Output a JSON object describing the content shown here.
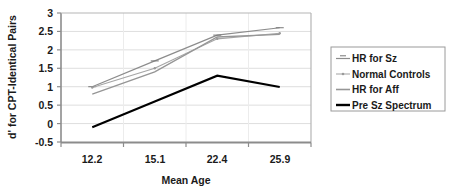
{
  "chart_data": {
    "type": "line",
    "title": "",
    "xlabel": "Mean Age",
    "ylabel": "d' for CPT-Identical Pairs",
    "categories": [
      "12.2",
      "15.1",
      "22.4",
      "25.9"
    ],
    "ylim": [
      -0.5,
      3
    ],
    "ytick_labels": [
      "3",
      "2.5",
      "2",
      "1.5",
      "1",
      "0.5",
      "0",
      "-0.5"
    ],
    "ytick_values": [
      3,
      2.5,
      2,
      1.5,
      1,
      0.5,
      0,
      -0.5
    ],
    "grid": true,
    "legend_position": "right",
    "series": [
      {
        "name": "HR for Sz",
        "values": [
          1.0,
          1.7,
          2.4,
          2.6
        ],
        "color": "#8c8c8c",
        "width": 1.2,
        "marker": "dash"
      },
      {
        "name": "Normal Controls",
        "values": [
          0.98,
          1.5,
          2.3,
          2.45
        ],
        "color": "#a6a6a6",
        "width": 1.2,
        "marker": "dot"
      },
      {
        "name": "HR for Aff",
        "values": [
          0.8,
          1.4,
          2.35,
          2.42
        ],
        "color": "#969696",
        "width": 1.4,
        "marker": "none"
      },
      {
        "name": "Pre Sz Spectrum",
        "values": [
          -0.1,
          0.6,
          1.3,
          0.99
        ],
        "color": "#000000",
        "width": 2.1,
        "marker": "none"
      }
    ]
  },
  "axes": {
    "y_label": "d' for CPT-Identical Pairs",
    "x_label": "Mean Age",
    "y_ticks": [
      "3",
      "2.5",
      "2",
      "1.5",
      "1",
      "0.5",
      "0",
      "-0.5"
    ],
    "x_ticks": [
      "12.2",
      "15.1",
      "22.4",
      "25.9"
    ]
  },
  "legend": {
    "items": [
      {
        "label": "HR for Sz",
        "color": "#8c8c8c"
      },
      {
        "label": "Normal Controls",
        "color": "#a6a6a6"
      },
      {
        "label": "HR for Aff",
        "color": "#969696"
      },
      {
        "label": "Pre Sz Spectrum",
        "color": "#000000"
      }
    ]
  },
  "colors": {
    "plot_border": "#808080",
    "gridline": "#d9d9d9",
    "legend_border": "#9a9a9a",
    "text": "#1a1a1a",
    "background": "#ffffff"
  }
}
